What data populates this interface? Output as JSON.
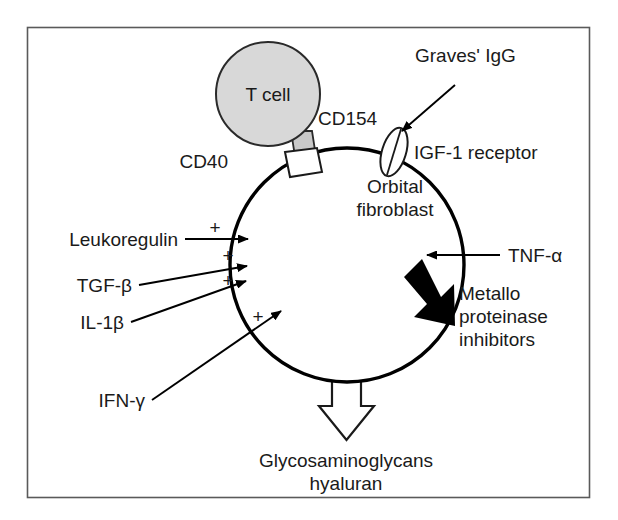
{
  "figure": {
    "type": "biological-signaling-diagram",
    "border_color": "#5a5a5a",
    "background": "#ffffff"
  },
  "cells": {
    "t_cell": {
      "label": "T cell",
      "fill": "#d8d8d8",
      "stroke": "#2a2a2a"
    },
    "fibroblast": {
      "label_line1": "Orbital",
      "label_line2": "fibroblast",
      "fill": "#ffffff",
      "stroke": "#000000"
    }
  },
  "receptors": {
    "cd154": {
      "label": "CD154",
      "fill": "#c9c9c9"
    },
    "cd40": {
      "label": "CD40",
      "fill": "#ffffff"
    },
    "igf1": {
      "label": "IGF-1 receptor",
      "fill": "#ffffff"
    }
  },
  "ligands": {
    "graves": {
      "label": "Graves' IgG"
    }
  },
  "stimulators": [
    {
      "label": "Leukoregulin",
      "sign": "+"
    },
    {
      "label": "TGF-β",
      "sign": "+"
    },
    {
      "label": "IL-1β",
      "sign": "+"
    },
    {
      "label": "IFN-γ",
      "sign": "+"
    }
  ],
  "inputs": [
    {
      "label": "TNF-α"
    }
  ],
  "outputs": {
    "metallo": {
      "line1": "Metallo",
      "line2": "proteinase",
      "line3": "inhibitors",
      "arrow_style": "thick-solid-black"
    },
    "gag": {
      "line1": "Glycosaminoglycans",
      "line2": "hyaluran",
      "arrow_style": "large-hollow-outline"
    }
  }
}
